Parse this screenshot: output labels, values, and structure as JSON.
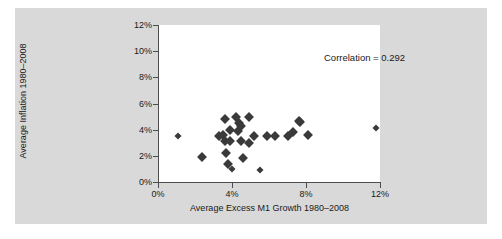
{
  "figure": {
    "background_color": "#d9d9d9",
    "plot_background_color": "#ffffff",
    "marker_color": "#3a3a3a",
    "axis_color": "#4d4d4d"
  },
  "annotation": {
    "correlation_text": "Correlation  =  0.292"
  },
  "chart_data": {
    "type": "scatter",
    "title": "",
    "subtitle": "",
    "xlabel": "Average Excess M1 Growth 1980–2008",
    "ylabel": "Average Inflation 1980–2008",
    "xlim": [
      0,
      12
    ],
    "ylim": [
      0,
      12
    ],
    "xticks": [
      0,
      4,
      8,
      12
    ],
    "yticks": [
      0,
      2,
      4,
      6,
      8,
      10,
      12
    ],
    "xtick_labels": [
      "0%",
      "4%",
      "8%",
      "12%"
    ],
    "ytick_labels": [
      "0%",
      "2%",
      "4%",
      "6%",
      "8%",
      "10%",
      "12%"
    ],
    "grid": false,
    "legend": null,
    "legend_position": "none",
    "annotations": [
      {
        "text": "Correlation  =  0.292",
        "x": 0.45,
        "y": 11.6
      }
    ],
    "correlation": 0.292,
    "series": [
      {
        "name": "Countries",
        "marker": "diamond",
        "color": "#3a3a3a",
        "points": [
          {
            "x": 1.1,
            "y": 3.5
          },
          {
            "x": 2.4,
            "y": 1.9
          },
          {
            "x": 3.3,
            "y": 3.5
          },
          {
            "x": 3.5,
            "y": 3.6
          },
          {
            "x": 3.6,
            "y": 4.8
          },
          {
            "x": 3.6,
            "y": 3.1
          },
          {
            "x": 3.7,
            "y": 2.2
          },
          {
            "x": 3.8,
            "y": 1.4
          },
          {
            "x": 3.9,
            "y": 4.0
          },
          {
            "x": 3.9,
            "y": 3.1
          },
          {
            "x": 4.0,
            "y": 1.0
          },
          {
            "x": 4.2,
            "y": 5.0
          },
          {
            "x": 4.3,
            "y": 3.9
          },
          {
            "x": 4.4,
            "y": 4.5
          },
          {
            "x": 4.5,
            "y": 4.3
          },
          {
            "x": 4.5,
            "y": 3.1
          },
          {
            "x": 4.6,
            "y": 1.8
          },
          {
            "x": 4.9,
            "y": 5.0
          },
          {
            "x": 4.9,
            "y": 3.0
          },
          {
            "x": 5.2,
            "y": 3.5
          },
          {
            "x": 5.5,
            "y": 0.9
          },
          {
            "x": 5.9,
            "y": 3.5
          },
          {
            "x": 6.3,
            "y": 3.5
          },
          {
            "x": 7.0,
            "y": 3.5
          },
          {
            "x": 7.3,
            "y": 3.8
          },
          {
            "x": 7.6,
            "y": 4.7
          },
          {
            "x": 7.7,
            "y": 4.6
          },
          {
            "x": 8.1,
            "y": 3.6
          },
          {
            "x": 11.8,
            "y": 4.1
          }
        ]
      }
    ]
  }
}
